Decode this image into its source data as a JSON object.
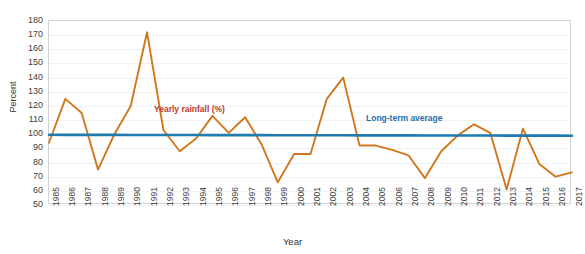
{
  "chart_data": {
    "type": "line",
    "title": "",
    "xlabel": "Year",
    "ylabel": "Percent",
    "ylim": [
      50,
      180
    ],
    "yticks": [
      180,
      170,
      160,
      150,
      140,
      130,
      120,
      110,
      100,
      90,
      80,
      70,
      60,
      50
    ],
    "grid": true,
    "legend_position": "inline-annotations",
    "categories": [
      "1985",
      "1986",
      "1987",
      "1988",
      "1989",
      "1990",
      "1991",
      "1992",
      "1993",
      "1994",
      "1995",
      "1996",
      "1997",
      "1998",
      "1999",
      "2000",
      "2001",
      "2002",
      "2003",
      "2004",
      "2005",
      "2006",
      "2007",
      "2008",
      "2009",
      "2010",
      "2011",
      "2012",
      "2013",
      "2014",
      "2015",
      "2016",
      "2017"
    ],
    "series": [
      {
        "name": "Yearly rainfall (%)",
        "color": "#D2761E",
        "values": [
          94,
          125,
          115,
          75,
          100,
          120,
          172,
          103,
          88,
          97,
          113,
          101,
          112,
          93,
          66,
          86,
          86,
          125,
          140,
          92,
          92,
          89,
          85,
          69,
          88,
          99,
          107,
          101,
          61,
          104,
          79,
          70,
          73
        ]
      },
      {
        "name": "Long-term average",
        "color": "#1F7BAE",
        "type": "trend",
        "values": [
          99.6,
          99.58,
          99.56,
          99.54,
          99.52,
          99.5,
          99.48,
          99.46,
          99.44,
          99.42,
          99.4,
          99.38,
          99.36,
          99.34,
          99.32,
          99.3,
          99.28,
          99.26,
          99.24,
          99.22,
          99.2,
          99.18,
          99.16,
          99.14,
          99.12,
          99.1,
          99.08,
          99.06,
          99.04,
          99.02,
          99.0,
          98.98,
          98.96
        ]
      }
    ],
    "annotations": [
      {
        "text": "Yearly rainfall (%)",
        "color": "#c0392b"
      },
      {
        "text": "Long-term average",
        "color": "#1f6fab"
      }
    ]
  }
}
